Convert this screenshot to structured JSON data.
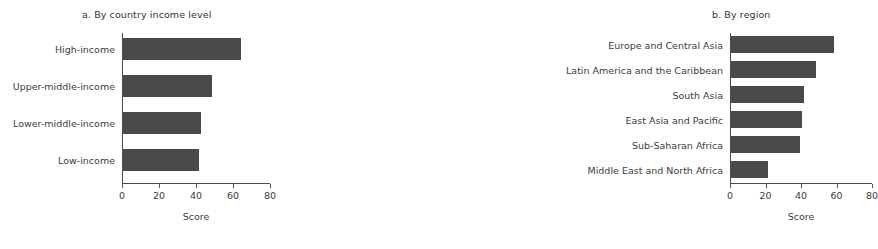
{
  "chart_data": [
    {
      "type": "bar",
      "orientation": "horizontal",
      "title": "a. By country income level",
      "xlabel": "Score",
      "ylabel": "",
      "xlim": [
        0,
        80
      ],
      "xticks": [
        0,
        20,
        40,
        60,
        80
      ],
      "grid": false,
      "legend": "none",
      "bar_color": "#4a4a4a",
      "categories": [
        "High-income",
        "Upper-middle-income",
        "Lower-middle-income",
        "Low-income"
      ],
      "values": [
        64,
        48,
        42,
        41
      ]
    },
    {
      "type": "bar",
      "orientation": "horizontal",
      "title": "b. By region",
      "xlabel": "Score",
      "ylabel": "",
      "xlim": [
        0,
        80
      ],
      "xticks": [
        0,
        20,
        40,
        60,
        80
      ],
      "grid": false,
      "legend": "none",
      "bar_color": "#4a4a4a",
      "categories": [
        "Europe and Central Asia",
        "Latin America and the Caribbean",
        "South Asia",
        "East Asia and Pacific",
        "Sub-Saharan Africa",
        "Middle East and North Africa"
      ],
      "values": [
        58,
        48,
        41,
        40,
        39,
        21
      ]
    }
  ]
}
